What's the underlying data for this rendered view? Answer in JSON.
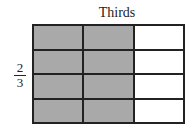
{
  "title": "Thirds",
  "fraction": {
    "numerator": "2",
    "denominator": "3"
  },
  "grid": {
    "rows": 4,
    "columns": 3,
    "shaded_columns": 2,
    "shade_color": "#a9a9a9",
    "empty_color": "#ffffff",
    "line_color": "#222222"
  }
}
